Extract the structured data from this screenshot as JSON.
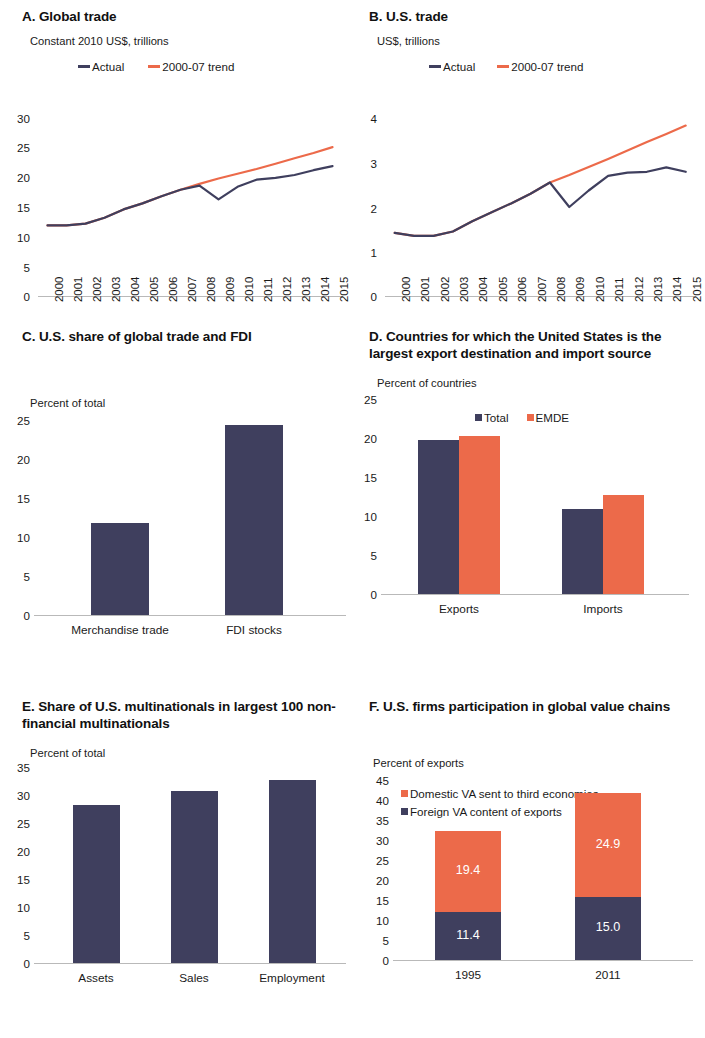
{
  "colors": {
    "navy": "#3f3f5e",
    "orange": "#ec6a4a",
    "axis": "#b9b9b9",
    "text": "#1a1a1a"
  },
  "panels": {
    "a": {
      "title": "A. Global trade",
      "unit": "Constant 2010 US$, trillions",
      "legend": [
        {
          "label": "Actual",
          "marker": "line-dash-navy"
        },
        {
          "label": "2000-07 trend",
          "marker": "line-dash-orange"
        }
      ]
    },
    "b": {
      "title": "B. U.S. trade",
      "unit": "US$, trillions",
      "legend": [
        {
          "label": "Actual",
          "marker": "line-dash-navy"
        },
        {
          "label": "2000-07 trend",
          "marker": "line-dash-orange"
        }
      ]
    },
    "c": {
      "title": "C. U.S. share of global trade and FDI",
      "unit": "Percent of total"
    },
    "d": {
      "title": "D. Countries for which the United States is the largest export destination and import source",
      "unit": "Percent of countries",
      "legend": [
        {
          "label": "Total",
          "marker": "square-navy"
        },
        {
          "label": "EMDE",
          "marker": "square-orange"
        }
      ]
    },
    "e": {
      "title": "E. Share of U.S. multinationals in largest 100 non-financial multinationals",
      "unit": "Percent of total"
    },
    "f": {
      "title": "F. U.S. firms participation in global value chains",
      "unit": "Percent of exports",
      "legend": [
        {
          "label": "Domestic VA sent to third economies",
          "marker": "square-orange"
        },
        {
          "label": "Foreign VA content of exports",
          "marker": "square-navy"
        }
      ]
    }
  },
  "chart_data": [
    {
      "id": "a",
      "type": "line",
      "title": "A. Global trade",
      "ylabel": "Constant 2010 US$, trillions",
      "xlabel": "",
      "ylim": [
        0,
        30
      ],
      "yticks": [
        0,
        5,
        10,
        15,
        20,
        25,
        30
      ],
      "x": [
        "2000",
        "2001",
        "2002",
        "2003",
        "2004",
        "2005",
        "2006",
        "2007",
        "2008",
        "2009",
        "2010",
        "2011",
        "2012",
        "2013",
        "2014",
        "2015"
      ],
      "grid": false,
      "legend_position": "top",
      "series": [
        {
          "name": "Actual",
          "color": "#3f3f5e",
          "values": [
            11.9,
            11.9,
            12.2,
            13.2,
            14.6,
            15.6,
            16.8,
            17.9,
            18.6,
            16.3,
            18.4,
            19.6,
            19.9,
            20.4,
            21.2,
            21.9
          ]
        },
        {
          "name": "2000-07 trend",
          "color": "#ec6a4a",
          "values": [
            11.9,
            11.9,
            12.2,
            13.2,
            14.6,
            15.6,
            16.8,
            17.9,
            18.9,
            19.8,
            20.6,
            21.4,
            22.3,
            23.2,
            24.1,
            25.1
          ]
        }
      ]
    },
    {
      "id": "b",
      "type": "line",
      "title": "B. U.S. trade",
      "ylabel": "US$, trillions",
      "xlabel": "",
      "ylim": [
        0,
        4
      ],
      "yticks": [
        0,
        1,
        2,
        3,
        4
      ],
      "x": [
        "2000",
        "2001",
        "2002",
        "2003",
        "2004",
        "2005",
        "2006",
        "2007",
        "2008",
        "2009",
        "2010",
        "2011",
        "2012",
        "2013",
        "2014",
        "2015"
      ],
      "grid": false,
      "legend_position": "top",
      "series": [
        {
          "name": "Actual",
          "color": "#3f3f5e",
          "values": [
            1.42,
            1.35,
            1.35,
            1.45,
            1.68,
            1.88,
            2.08,
            2.3,
            2.55,
            2.0,
            2.37,
            2.7,
            2.77,
            2.79,
            2.89,
            2.79
          ]
        },
        {
          "name": "2000-07 trend",
          "color": "#ec6a4a",
          "values": [
            1.42,
            1.35,
            1.35,
            1.45,
            1.68,
            1.88,
            2.08,
            2.3,
            2.55,
            2.72,
            2.9,
            3.08,
            3.27,
            3.46,
            3.64,
            3.83
          ]
        }
      ]
    },
    {
      "id": "c",
      "type": "bar",
      "title": "C. U.S. share of global trade and FDI",
      "ylabel": "Percent of total",
      "xlabel": "",
      "ylim": [
        0,
        25
      ],
      "yticks": [
        0,
        5,
        10,
        15,
        20,
        25
      ],
      "categories": [
        "Merchandise trade",
        "FDI stocks"
      ],
      "values": [
        11.3,
        23.3
      ],
      "color": "#3f3f5e",
      "grid": false
    },
    {
      "id": "d",
      "type": "bar",
      "title": "D. Countries for which the United States is the largest export destination and import source",
      "ylabel": "Percent of countries",
      "xlabel": "",
      "ylim": [
        0,
        25
      ],
      "yticks": [
        0,
        5,
        10,
        15,
        20,
        25
      ],
      "categories": [
        "Exports",
        "Imports"
      ],
      "legend_position": "top",
      "series": [
        {
          "name": "Total",
          "color": "#3f3f5e",
          "values": [
            18.9,
            10.5
          ]
        },
        {
          "name": "EMDE",
          "color": "#ec6a4a",
          "values": [
            19.4,
            12.2
          ]
        }
      ],
      "grid": false
    },
    {
      "id": "e",
      "type": "bar",
      "title": "E. Share of U.S. multinationals in largest 100 non-financial multinationals",
      "ylabel": "Percent of total",
      "xlabel": "",
      "ylim": [
        0,
        35
      ],
      "yticks": [
        0,
        5,
        10,
        15,
        20,
        25,
        30,
        35
      ],
      "categories": [
        "Assets",
        "Sales",
        "Employment"
      ],
      "values": [
        27.4,
        29.8,
        31.7
      ],
      "color": "#3f3f5e",
      "grid": false
    },
    {
      "id": "f",
      "type": "bar",
      "stacked": true,
      "title": "F. U.S. firms participation in global value chains",
      "ylabel": "Percent of exports",
      "xlabel": "",
      "ylim": [
        0,
        45
      ],
      "yticks": [
        0,
        5,
        10,
        15,
        20,
        25,
        30,
        35,
        40,
        45
      ],
      "categories": [
        "1995",
        "2011"
      ],
      "legend_position": "top",
      "series": [
        {
          "name": "Foreign VA content of exports",
          "color": "#3f3f5e",
          "values": [
            11.4,
            15.0
          ],
          "labels": [
            "11.4",
            "15.0"
          ]
        },
        {
          "name": "Domestic VA sent to third economies",
          "color": "#ec6a4a",
          "values": [
            19.4,
            24.9
          ],
          "labels": [
            "19.4",
            "24.9"
          ]
        }
      ],
      "totals": [
        30.8,
        39.9
      ],
      "grid": false
    }
  ]
}
